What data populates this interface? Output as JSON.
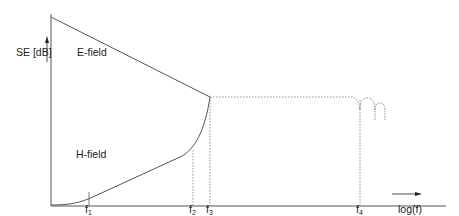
{
  "diagram": {
    "y_axis_label": "SE [dB]",
    "x_axis_label": "log(f)",
    "curves": {
      "e_field_label": "E-field",
      "h_field_label": "H-field"
    },
    "ticks": [
      {
        "base": "f",
        "sub": "1"
      },
      {
        "base": "f",
        "sub": "2"
      },
      {
        "base": "f",
        "sub": "3"
      },
      {
        "base": "f",
        "sub": "4"
      }
    ],
    "colors": {
      "line": "#555555",
      "dashed": "#777777",
      "text": "#222222"
    }
  }
}
